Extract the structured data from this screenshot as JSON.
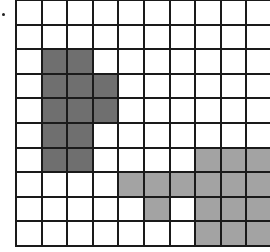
{
  "figure": {
    "marker": "bullet",
    "grid": {
      "rows": 10,
      "cols": 10,
      "cell_width": 25.6,
      "cell_height": 24.6,
      "line_color": "#1a1a1a",
      "background": "#ffffff"
    },
    "shapes": [
      {
        "name": "dark-shape",
        "color": "#6f6f6f",
        "cells": [
          [
            2,
            1
          ],
          [
            2,
            2
          ],
          [
            3,
            1
          ],
          [
            3,
            2
          ],
          [
            3,
            3
          ],
          [
            4,
            1
          ],
          [
            4,
            2
          ],
          [
            4,
            3
          ],
          [
            5,
            1
          ],
          [
            5,
            2
          ],
          [
            6,
            1
          ],
          [
            6,
            2
          ]
        ]
      },
      {
        "name": "light-shape",
        "color": "#a3a3a3",
        "cells": [
          [
            6,
            7
          ],
          [
            6,
            8
          ],
          [
            6,
            9
          ],
          [
            7,
            4
          ],
          [
            7,
            5
          ],
          [
            7,
            6
          ],
          [
            7,
            7
          ],
          [
            7,
            8
          ],
          [
            7,
            9
          ],
          [
            8,
            5
          ],
          [
            8,
            7
          ],
          [
            8,
            8
          ],
          [
            8,
            9
          ],
          [
            9,
            7
          ],
          [
            9,
            8
          ],
          [
            9,
            9
          ]
        ]
      }
    ]
  }
}
